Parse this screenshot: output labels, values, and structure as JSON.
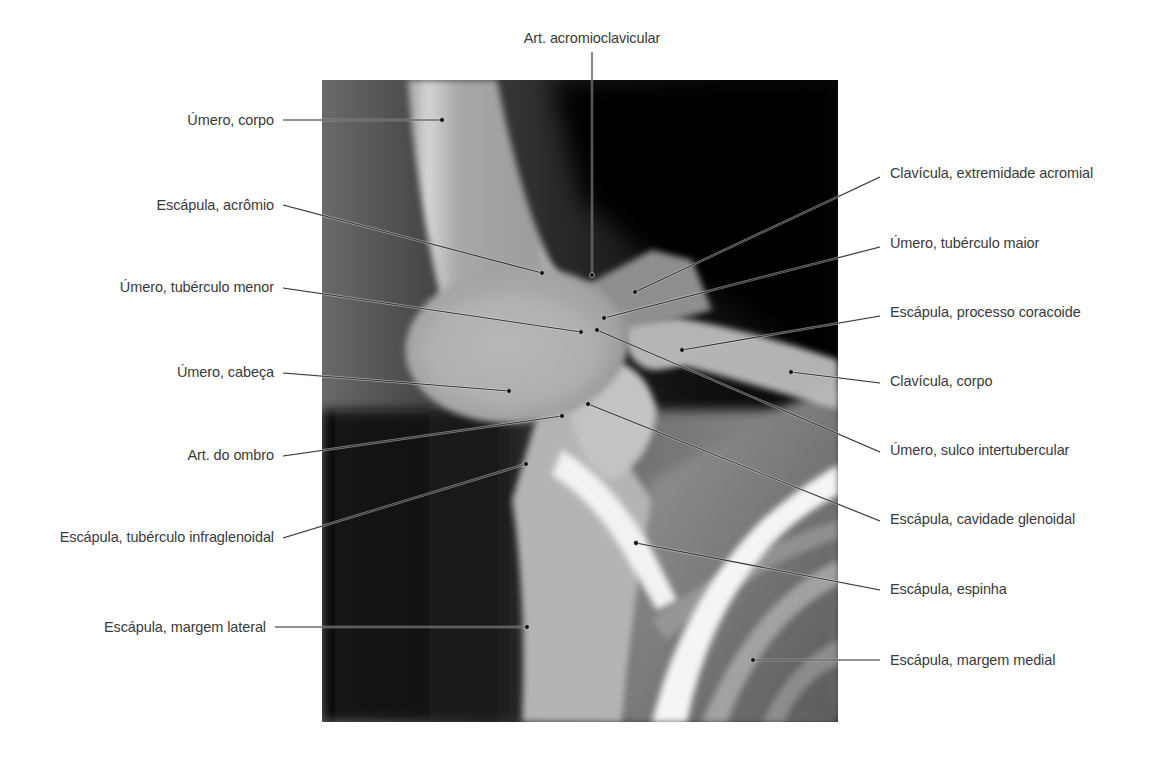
{
  "figure": {
    "image_region": {
      "x": 322,
      "y": 80,
      "width": 516,
      "height": 642
    },
    "colors": {
      "label_text": "#3a3a3a",
      "leader_line": "#333333",
      "leader_dot": "#111111",
      "background": "#ffffff"
    },
    "labels": [
      {
        "id": "art-acromioclavicular",
        "text": "Art. acromioclavicular",
        "side": "top",
        "tx": 592,
        "ty": 38,
        "lx": 592,
        "ly": 52,
        "px": 592,
        "py": 275
      },
      {
        "id": "umero-corpo",
        "text": "Úmero, corpo",
        "side": "left",
        "tx": 274,
        "ty": 120,
        "lx": 283,
        "ly": 120,
        "px": 442,
        "py": 120
      },
      {
        "id": "escapula-acromio",
        "text": "Escápula, acrômio",
        "side": "left",
        "tx": 274,
        "ty": 205,
        "lx": 283,
        "ly": 205,
        "px": 542,
        "py": 273
      },
      {
        "id": "umero-tuberculo-menor",
        "text": "Úmero, tubérculo menor",
        "side": "left",
        "tx": 274,
        "ty": 287,
        "lx": 283,
        "ly": 288,
        "px": 581,
        "py": 332
      },
      {
        "id": "umero-cabeca",
        "text": "Úmero, cabeça",
        "side": "left",
        "tx": 274,
        "ty": 372,
        "lx": 283,
        "ly": 373,
        "px": 509,
        "py": 391
      },
      {
        "id": "art-do-ombro",
        "text": "Art. do ombro",
        "side": "left",
        "tx": 274,
        "ty": 455,
        "lx": 283,
        "ly": 456,
        "px": 562,
        "py": 416
      },
      {
        "id": "escapula-tuberculo-infraglenoidal",
        "text": "Escápula, tubérculo infraglenoidal",
        "side": "left",
        "tx": 274,
        "ty": 537,
        "lx": 283,
        "ly": 538,
        "px": 526,
        "py": 464
      },
      {
        "id": "escapula-margem-lateral",
        "text": "Escápula, margem lateral",
        "side": "left",
        "tx": 266,
        "ty": 627,
        "lx": 275,
        "ly": 627,
        "px": 527,
        "py": 627
      },
      {
        "id": "clavicula-extremidade-acromial",
        "text": "Clavícula, extremidade acromial",
        "side": "right",
        "tx": 890,
        "ty": 173,
        "lx": 880,
        "ly": 177,
        "px": 635,
        "py": 292
      },
      {
        "id": "umero-tuberculo-maior",
        "text": "Úmero, tubérculo maior",
        "side": "right",
        "tx": 890,
        "ty": 243,
        "lx": 880,
        "ly": 247,
        "px": 604,
        "py": 318
      },
      {
        "id": "escapula-processo-coracoide",
        "text": "Escápula, processo coracoide",
        "side": "right",
        "tx": 890,
        "ty": 312,
        "lx": 880,
        "ly": 316,
        "px": 682,
        "py": 350
      },
      {
        "id": "clavicula-corpo",
        "text": "Clavícula, corpo",
        "side": "right",
        "tx": 890,
        "ty": 381,
        "lx": 880,
        "ly": 383,
        "px": 791,
        "py": 372
      },
      {
        "id": "umero-sulco-intertubercular",
        "text": "Úmero, sulco intertubercular",
        "side": "right",
        "tx": 890,
        "ty": 450,
        "lx": 880,
        "ly": 452,
        "px": 597,
        "py": 330
      },
      {
        "id": "escapula-cavidade-glenoidal",
        "text": "Escápula, cavidade glenoidal",
        "side": "right",
        "tx": 890,
        "ty": 519,
        "lx": 880,
        "ly": 521,
        "px": 588,
        "py": 404
      },
      {
        "id": "escapula-espinha",
        "text": "Escápula, espinha",
        "side": "right",
        "tx": 890,
        "ty": 589,
        "lx": 880,
        "ly": 590,
        "px": 636,
        "py": 543
      },
      {
        "id": "escapula-margem-medial",
        "text": "Escápula, margem medial",
        "side": "right",
        "tx": 890,
        "ty": 660,
        "lx": 880,
        "ly": 660,
        "px": 753,
        "py": 660
      }
    ]
  }
}
